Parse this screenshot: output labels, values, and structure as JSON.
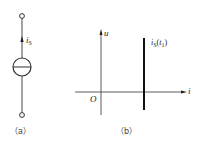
{
  "figure_a": {
    "caption": "（a）",
    "current_label": {
      "symbol": "i",
      "subscript": "S"
    },
    "element": "ideal current source"
  },
  "figure_b": {
    "caption": "（b）",
    "y_axis_label": "u",
    "x_axis_label": "i",
    "origin_label": "O",
    "line_label": {
      "symbol": "i",
      "subscript": "S",
      "arg_symbol": "t",
      "arg_subscript": "1"
    }
  },
  "colors": {
    "line": "#222222",
    "background": "#ffffff"
  }
}
